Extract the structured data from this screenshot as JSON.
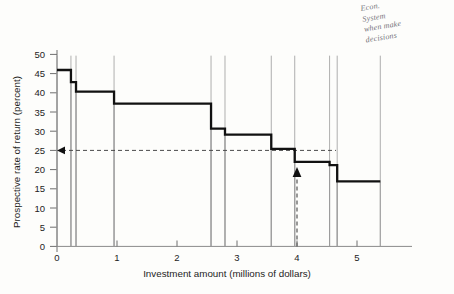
{
  "chart_data": {
    "type": "bar",
    "title": "",
    "subtitle": "",
    "xlabel": "Investment amount (millions of dollars)",
    "ylabel": "Prospective rate of return (percent)",
    "xlim": [
      0,
      5.6
    ],
    "ylim": [
      0,
      52
    ],
    "xticks": [
      0,
      1,
      2,
      3,
      4,
      5
    ],
    "xtick_labels": [
      "0",
      "1",
      "2",
      "3",
      "4",
      "5"
    ],
    "yticks": [
      0,
      5,
      10,
      15,
      20,
      25,
      30,
      35,
      40,
      45,
      50
    ],
    "ytick_labels": [
      "0",
      "5",
      "10",
      "15",
      "20",
      "25",
      "30",
      "35",
      "40",
      "45",
      "50"
    ],
    "grid": false,
    "legend": null,
    "step_edges": [
      0.0,
      0.22,
      0.3,
      0.9,
      2.43,
      2.65,
      3.38,
      3.75,
      4.3,
      4.42,
      5.1
    ],
    "step_values": [
      46.7,
      43.5,
      41.0,
      37.8,
      31.2,
      29.6,
      25.8,
      22.4,
      21.5,
      17.2
    ],
    "bars": [
      {
        "x0": 0.0,
        "x1": 0.22,
        "value": 46.7
      },
      {
        "x0": 0.22,
        "x1": 0.3,
        "value": 43.5
      },
      {
        "x0": 0.3,
        "x1": 0.9,
        "value": 41.0
      },
      {
        "x0": 0.9,
        "x1": 2.43,
        "value": 37.8
      },
      {
        "x0": 2.43,
        "x1": 2.65,
        "value": 31.2
      },
      {
        "x0": 2.65,
        "x1": 3.38,
        "value": 29.6
      },
      {
        "x0": 3.38,
        "x1": 3.75,
        "value": 25.8
      },
      {
        "x0": 3.75,
        "x1": 4.3,
        "value": 22.4
      },
      {
        "x0": 4.3,
        "x1": 4.42,
        "value": 21.5
      },
      {
        "x0": 4.42,
        "x1": 5.1,
        "value": 17.2
      }
    ],
    "annotations": [
      {
        "name": "rate-of-return-reference",
        "type": "hline",
        "value": 25,
        "style": "dashed",
        "arrow": "left"
      },
      {
        "name": "investment-amount-reference",
        "type": "vline",
        "value": 4.0,
        "style": "dashed",
        "arrow": "up",
        "from": 0,
        "to": 22.4
      }
    ]
  },
  "margin_note": {
    "lines": [
      "Econ.",
      "System",
      "when make",
      "decisions"
    ]
  }
}
